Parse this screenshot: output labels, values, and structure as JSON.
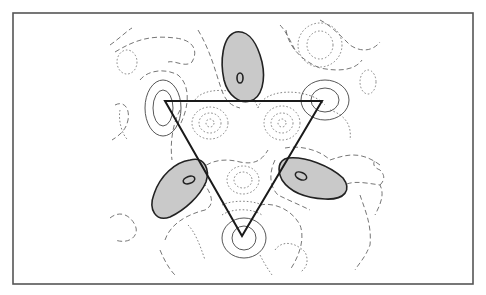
{
  "figure": {
    "colors": {
      "frame": "#555555",
      "lobe_fill": "#c9c9c9",
      "lobe_stroke": "#222222",
      "triangle": "#1a1a1a",
      "contour": "#666666"
    },
    "frame": {
      "x": 13,
      "y": 13,
      "width": 460,
      "height": 271
    },
    "triangle": {
      "vertices": [
        [
          165,
          101
        ],
        [
          322,
          101
        ],
        [
          242,
          236
        ]
      ]
    },
    "lobes": [
      {
        "name": "top",
        "center": [
          240,
          58
        ]
      },
      {
        "name": "lower-left",
        "center": [
          183,
          188
        ]
      },
      {
        "name": "lower-right",
        "center": [
          300,
          184
        ]
      }
    ],
    "legend": {
      "solid_line": "positive contour",
      "dashed_line": "zero/low contour",
      "dotted_line": "negative contour"
    }
  }
}
